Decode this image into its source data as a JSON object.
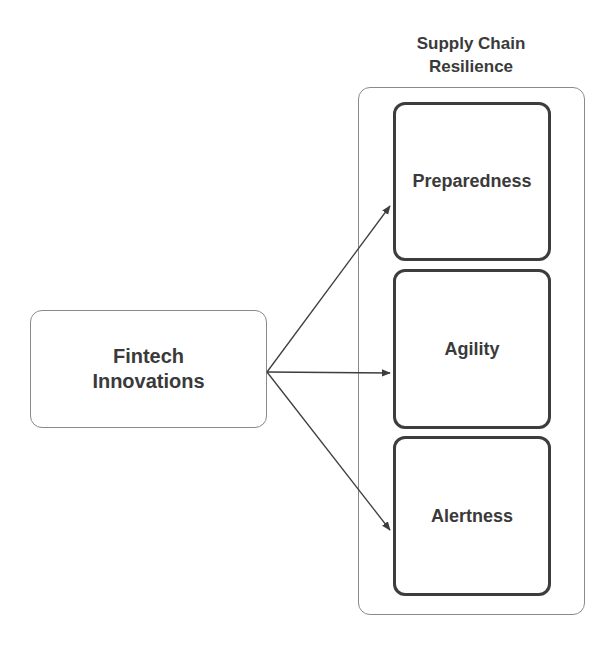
{
  "diagram": {
    "source": {
      "label_line1": "Fintech",
      "label_line2": "Innovations"
    },
    "group": {
      "title_line1": "Supply Chain",
      "title_line2": "Resilience",
      "items": [
        {
          "label": "Preparedness"
        },
        {
          "label": "Agility"
        },
        {
          "label": "Alertness"
        }
      ]
    },
    "edges": [
      {
        "from": "Fintech Innovations",
        "to": "Preparedness"
      },
      {
        "from": "Fintech Innovations",
        "to": "Agility"
      },
      {
        "from": "Fintech Innovations",
        "to": "Alertness"
      }
    ],
    "colors": {
      "stroke": "#3d3d3d",
      "thin_border": "#8a8a8a",
      "text": "#3a3a3a",
      "background": "#ffffff"
    }
  }
}
